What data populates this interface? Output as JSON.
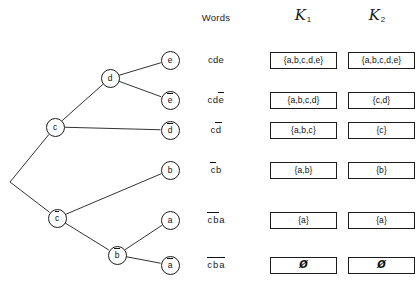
{
  "headers": {
    "words": "Words",
    "k1_letter": "K",
    "k1_sub": "1",
    "k2_letter": "K",
    "k2_sub": "2"
  },
  "tree": {
    "root": {
      "name": "root-vertex",
      "x": 10,
      "y": 182
    },
    "nodes": [
      {
        "id": "c",
        "label": "c",
        "bar": false,
        "x": 55,
        "y": 127
      },
      {
        "id": "cbar",
        "label": "c",
        "bar": true,
        "x": 57,
        "y": 218
      },
      {
        "id": "d",
        "label": "d",
        "bar": false,
        "x": 110,
        "y": 78
      },
      {
        "id": "dbar",
        "label": "d",
        "bar": true,
        "x": 170,
        "y": 130
      },
      {
        "id": "b",
        "label": "b",
        "bar": false,
        "x": 170,
        "y": 170
      },
      {
        "id": "bbar",
        "label": "b",
        "bar": true,
        "x": 117,
        "y": 255
      },
      {
        "id": "e",
        "label": "e",
        "bar": false,
        "x": 170,
        "y": 60
      },
      {
        "id": "ebar",
        "label": "e",
        "bar": true,
        "x": 170,
        "y": 100
      },
      {
        "id": "a",
        "label": "a",
        "bar": false,
        "x": 170,
        "y": 220
      },
      {
        "id": "abar",
        "label": "a",
        "bar": true,
        "x": 170,
        "y": 265
      }
    ],
    "edges": [
      {
        "from": "root",
        "to": "c"
      },
      {
        "from": "root",
        "to": "cbar"
      },
      {
        "from": "c",
        "to": "d"
      },
      {
        "from": "c",
        "to": "dbar"
      },
      {
        "from": "d",
        "to": "e"
      },
      {
        "from": "d",
        "to": "ebar"
      },
      {
        "from": "cbar",
        "to": "b"
      },
      {
        "from": "cbar",
        "to": "bbar"
      },
      {
        "from": "bbar",
        "to": "a"
      },
      {
        "from": "bbar",
        "to": "abar"
      }
    ]
  },
  "rows": [
    {
      "leaf": "e",
      "y": 60,
      "word_letters": [
        {
          "ch": "c",
          "bar": false
        },
        {
          "ch": "d",
          "bar": false
        },
        {
          "ch": "e",
          "bar": false
        }
      ],
      "word_plain": "cde",
      "k1": "{a,b,c,d,e}",
      "k2": "{a,b,c,d,e}"
    },
    {
      "leaf": "ebar",
      "y": 100,
      "word_letters": [
        {
          "ch": "c",
          "bar": false
        },
        {
          "ch": "d",
          "bar": false
        },
        {
          "ch": "e",
          "bar": true
        }
      ],
      "word_plain": "cdē",
      "k1": "{a,b,c,d}",
      "k2": "{c,d}"
    },
    {
      "leaf": "dbar",
      "y": 130,
      "word_letters": [
        {
          "ch": "c",
          "bar": false
        },
        {
          "ch": "d",
          "bar": true
        }
      ],
      "word_plain": "cd̄",
      "k1": "{a,b,c}",
      "k2": "{c}"
    },
    {
      "leaf": "b",
      "y": 170,
      "word_letters": [
        {
          "ch": "c",
          "bar": true
        },
        {
          "ch": "b",
          "bar": false
        }
      ],
      "word_plain": "c̄b",
      "k1": "{a,b}",
      "k2": "{b}"
    },
    {
      "leaf": "a",
      "y": 220,
      "word_letters": [
        {
          "ch": "c",
          "bar": true
        },
        {
          "ch": "b",
          "bar": true
        },
        {
          "ch": "a",
          "bar": false
        }
      ],
      "word_plain": "c̄b̄a",
      "k1": "{a}",
      "k2": "{a}"
    },
    {
      "leaf": "abar",
      "y": 265,
      "word_letters": [
        {
          "ch": "c",
          "bar": true
        },
        {
          "ch": "b",
          "bar": true
        },
        {
          "ch": "a",
          "bar": true
        }
      ],
      "word_plain": "c̄b̄ā",
      "k1": "Ø",
      "k2": "Ø"
    }
  ],
  "colors": {
    "ink": "#1c1c1c",
    "background": "#ffffff"
  }
}
